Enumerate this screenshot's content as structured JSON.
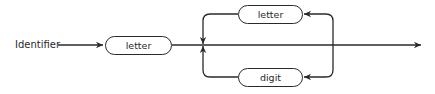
{
  "diagram": {
    "type": "syntax-diagram",
    "title_label": "Identifier",
    "nodes": [
      {
        "id": "first",
        "label": "letter"
      },
      {
        "id": "loop-top",
        "label": "letter"
      },
      {
        "id": "loop-bottom",
        "label": "digit"
      }
    ],
    "edges": [
      {
        "from": "Identifier",
        "to": "first"
      },
      {
        "from": "first",
        "to": "exit"
      },
      {
        "from": "junction",
        "to": "loop-top",
        "direction": "loop-back"
      },
      {
        "from": "junction",
        "to": "loop-bottom",
        "direction": "loop-back"
      }
    ],
    "colors": {
      "stroke": "#2a2a2a",
      "background": "#ffffff"
    }
  }
}
